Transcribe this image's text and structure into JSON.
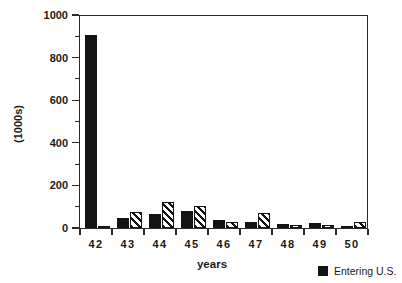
{
  "chart_data": {
    "type": "bar",
    "title": "",
    "subtitle": "",
    "xlabel": "years",
    "ylabel": "(1000s)",
    "categories": [
      "42",
      "43",
      "44",
      "45",
      "46",
      "47",
      "48",
      "49",
      "50"
    ],
    "series": [
      {
        "name": "Entering U.S.",
        "style": "solid-black",
        "color": "#131313",
        "values": [
          905,
          47,
          65,
          78,
          38,
          26,
          20,
          22,
          5
        ]
      },
      {
        "name": "",
        "style": "diagonal-hatch",
        "color": "#131313",
        "values": [
          4,
          75,
          122,
          105,
          28,
          70,
          15,
          14,
          26
        ]
      }
    ],
    "ylim": [
      0,
      1000
    ],
    "yticks": [
      0,
      200,
      400,
      600,
      800,
      1000
    ],
    "ytick_labels": [
      "0",
      "200",
      "400",
      "600",
      "800",
      "1000"
    ],
    "yminor_ticks": [
      100,
      300,
      500,
      700,
      900
    ],
    "grid": false,
    "legend_position": "bottom-right",
    "legend_entries": [
      {
        "label": "Entering U.S.",
        "swatch": "solid-black"
      }
    ]
  },
  "axes": {
    "y_label": "(1000s)",
    "x_label": "years"
  },
  "legend": {
    "entry_0_label": "Entering U.S."
  }
}
